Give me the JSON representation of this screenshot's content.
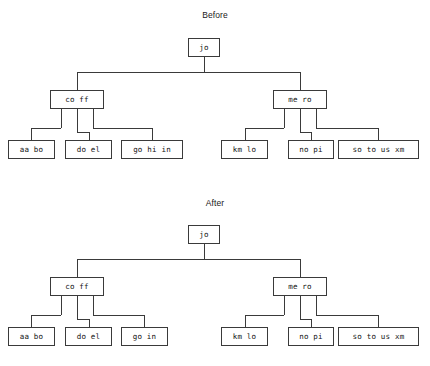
{
  "diagram": {
    "type": "tree-comparison",
    "panels": [
      {
        "key": "before",
        "title": "Before",
        "root": {
          "label": "jo"
        },
        "internal": [
          {
            "label": "co ff"
          },
          {
            "label": "me ro"
          }
        ],
        "leaves_left": [
          {
            "label": "aa bo"
          },
          {
            "label": "do el"
          },
          {
            "label": "go hi in"
          }
        ],
        "leaves_right": [
          {
            "label": "km lo"
          },
          {
            "label": "no pi"
          },
          {
            "label": "so to us xm"
          }
        ]
      },
      {
        "key": "after",
        "title": "After",
        "root": {
          "label": "jo"
        },
        "internal": [
          {
            "label": "co ff"
          },
          {
            "label": "me ro"
          }
        ],
        "leaves_left": [
          {
            "label": "aa bo"
          },
          {
            "label": "do el"
          },
          {
            "label": "go in"
          }
        ],
        "leaves_right": [
          {
            "label": "km lo"
          },
          {
            "label": "no pi"
          },
          {
            "label": "so to us xm"
          }
        ]
      }
    ],
    "colors": {
      "background": "#ffffff",
      "node_fill": "#ffffff",
      "node_border": "#3a3a3a",
      "line": "#3a3a3a",
      "text": "#111111"
    }
  }
}
